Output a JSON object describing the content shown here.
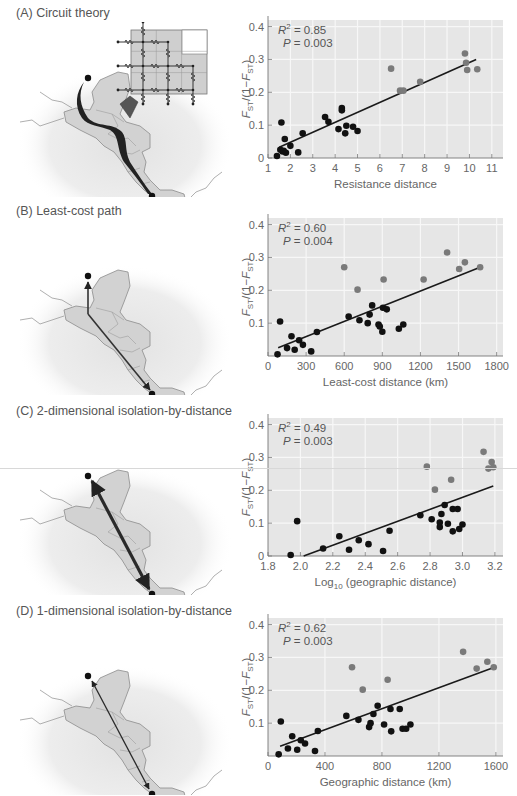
{
  "figure": {
    "panels": [
      {
        "id": "A",
        "title": "(A)  Circuit theory",
        "map_style": "circuit"
      },
      {
        "id": "B",
        "title": "(B)  Least-cost path",
        "map_style": "leastcost"
      },
      {
        "id": "C",
        "title": "(C)  2-dimensional isolation-by-distance",
        "map_style": "straight-thick"
      },
      {
        "id": "D",
        "title": "(D)  1-dimensional isolation-by-distance",
        "map_style": "straight-thin"
      }
    ]
  },
  "colors": {
    "plot_bg": "#e6e6e6",
    "grid": "#f7f7f7",
    "dot_dark": "#111111",
    "dot_gray": "#7a7a7a",
    "line": "#1a1a1a",
    "axis_text": "#666666",
    "map_land": "#d2d2d2",
    "map_halo": "#ececec"
  },
  "chart_data": [
    {
      "type": "scatter",
      "panel": "A",
      "title": "Circuit theory",
      "xlabel": "Resistance distance",
      "ylabel": "F_ST/(1−F_ST)",
      "xlim": [
        1,
        11.5
      ],
      "ylim": [
        0,
        0.42
      ],
      "xticks": [
        1,
        2,
        3,
        4,
        5,
        6,
        7,
        8,
        9,
        10,
        11
      ],
      "xtick_labels": [
        "1",
        "2",
        "3",
        "4",
        "5",
        "6",
        "7",
        "8",
        "9",
        "10",
        "11"
      ],
      "yticks": [
        0,
        0.1,
        0.2,
        0.3,
        0.4
      ],
      "ytick_labels": [
        "0",
        "0.1",
        "0.2",
        "0.3",
        "0.4"
      ],
      "grid": true,
      "annotation": {
        "r2": "= 0.85",
        "p": "= 0.003"
      },
      "fit_line": [
        [
          1.5,
          0.033
        ],
        [
          10.3,
          0.3
        ]
      ],
      "series": [
        {
          "name": "dark",
          "points": [
            [
              1.4,
              0.006
            ],
            [
              1.55,
              0.025
            ],
            [
              1.6,
              0.108
            ],
            [
              1.65,
              0.02
            ],
            [
              1.7,
              0.022
            ],
            [
              1.75,
              0.058
            ],
            [
              1.8,
              0.016
            ],
            [
              2.0,
              0.037
            ],
            [
              2.35,
              0.017
            ],
            [
              2.55,
              0.075
            ],
            [
              3.55,
              0.125
            ],
            [
              3.7,
              0.11
            ],
            [
              4.15,
              0.088
            ],
            [
              4.3,
              0.152
            ],
            [
              4.3,
              0.145
            ],
            [
              4.45,
              0.075
            ],
            [
              4.5,
              0.098
            ],
            [
              4.8,
              0.095
            ],
            [
              5.0,
              0.082
            ]
          ]
        },
        {
          "name": "gray",
          "points": [
            [
              6.5,
              0.272
            ],
            [
              6.9,
              0.205
            ],
            [
              7.05,
              0.205
            ],
            [
              7.8,
              0.232
            ],
            [
              9.8,
              0.318
            ],
            [
              9.85,
              0.29
            ],
            [
              9.9,
              0.268
            ],
            [
              10.35,
              0.27
            ]
          ]
        }
      ]
    },
    {
      "type": "scatter",
      "panel": "B",
      "title": "Least-cost path",
      "xlabel": "Least-cost distance (km)",
      "ylabel": "F_ST/(1−F_ST)",
      "xlim": [
        0,
        1850
      ],
      "ylim": [
        0,
        0.42
      ],
      "xticks": [
        0,
        300,
        600,
        900,
        1200,
        1500,
        1800
      ],
      "xtick_labels": [
        "0",
        "300",
        "600",
        "900",
        "1200",
        "1500",
        "1800"
      ],
      "yticks": [
        0.1,
        0.2,
        0.3,
        0.4
      ],
      "ytick_labels": [
        "0.1",
        "0.2",
        "0.3",
        "0.4"
      ],
      "grid": true,
      "annotation": {
        "r2": "= 0.60",
        "p": "= 0.004"
      },
      "fit_line": [
        [
          80,
          0.025
        ],
        [
          1670,
          0.27
        ]
      ],
      "series": [
        {
          "name": "dark",
          "points": [
            [
              75,
              0.005
            ],
            [
              95,
              0.105
            ],
            [
              150,
              0.024
            ],
            [
              185,
              0.06
            ],
            [
              210,
              0.019
            ],
            [
              245,
              0.048
            ],
            [
              275,
              0.034
            ],
            [
              340,
              0.014
            ],
            [
              385,
              0.073
            ],
            [
              635,
              0.12
            ],
            [
              720,
              0.109
            ],
            [
              785,
              0.1
            ],
            [
              800,
              0.126
            ],
            [
              820,
              0.154
            ],
            [
              870,
              0.096
            ],
            [
              880,
              0.09
            ],
            [
              900,
              0.074
            ],
            [
              905,
              0.147
            ],
            [
              935,
              0.142
            ],
            [
              1030,
              0.083
            ],
            [
              1065,
              0.096
            ]
          ]
        },
        {
          "name": "gray",
          "points": [
            [
              600,
              0.27
            ],
            [
              705,
              0.202
            ],
            [
              910,
              0.233
            ],
            [
              1225,
              0.233
            ],
            [
              1410,
              0.315
            ],
            [
              1505,
              0.265
            ],
            [
              1550,
              0.285
            ],
            [
              1670,
              0.27
            ]
          ]
        }
      ]
    },
    {
      "type": "scatter",
      "panel": "C",
      "title": "2-dimensional isolation-by-distance",
      "xlabel": "Log10 (geographic distance)",
      "ylabel": "F_ST/(1−F_ST)",
      "xlim": [
        1.8,
        3.25
      ],
      "ylim": [
        0,
        0.42
      ],
      "xticks": [
        1.8,
        2.0,
        2.2,
        2.4,
        2.6,
        2.8,
        3.0,
        3.2
      ],
      "xtick_labels": [
        "1.8",
        "2.0",
        "2.2",
        "2.4",
        "2.6",
        "2.8",
        "3.0",
        "3.2"
      ],
      "yticks": [
        0,
        0.1,
        0.2,
        0.3,
        0.4
      ],
      "ytick_labels": [
        "0",
        "0.1",
        "0.2",
        "0.3",
        "0.4"
      ],
      "grid": true,
      "annotation": {
        "r2": "= 0.49",
        "p": "= 0.003"
      },
      "fit_line": [
        [
          2.02,
          0.0
        ],
        [
          3.19,
          0.213
        ]
      ],
      "series": [
        {
          "name": "dark",
          "points": [
            [
              1.94,
              0.003
            ],
            [
              1.98,
              0.106
            ],
            [
              2.14,
              0.023
            ],
            [
              2.24,
              0.06
            ],
            [
              2.3,
              0.019
            ],
            [
              2.36,
              0.048
            ],
            [
              2.42,
              0.036
            ],
            [
              2.51,
              0.015
            ],
            [
              2.55,
              0.077
            ],
            [
              2.74,
              0.124
            ],
            [
              2.81,
              0.112
            ],
            [
              2.86,
              0.102
            ],
            [
              2.86,
              0.088
            ],
            [
              2.87,
              0.128
            ],
            [
              2.89,
              0.155
            ],
            [
              2.91,
              0.098
            ],
            [
              2.94,
              0.143
            ],
            [
              2.94,
              0.075
            ],
            [
              2.97,
              0.143
            ],
            [
              2.98,
              0.082
            ],
            [
              3.0,
              0.096
            ]
          ]
        },
        {
          "name": "gray",
          "points": [
            [
              2.78,
              0.272
            ],
            [
              2.83,
              0.202
            ],
            [
              2.93,
              0.232
            ],
            [
              3.13,
              0.317
            ],
            [
              3.16,
              0.266
            ],
            [
              3.18,
              0.286
            ],
            [
              3.19,
              0.27
            ]
          ]
        }
      ]
    },
    {
      "type": "scatter",
      "panel": "D",
      "title": "1-dimensional isolation-by-distance",
      "xlabel": "Geographic distance (km)",
      "ylabel": "F_ST/(1−F_ST)",
      "xlim": [
        0,
        1650
      ],
      "ylim": [
        0,
        0.42
      ],
      "xticks": [
        0,
        400,
        800,
        1200,
        1600
      ],
      "xtick_labels": [
        "0",
        "400",
        "800",
        "1200",
        "1600"
      ],
      "yticks": [
        0.1,
        0.2,
        0.3,
        0.4
      ],
      "ytick_labels": [
        "0.1",
        "0.2",
        "0.3",
        "0.4"
      ],
      "grid": true,
      "annotation": {
        "r2": "= 0.62",
        "p": "= 0.003"
      },
      "fit_line": [
        [
          85,
          0.03
        ],
        [
          1590,
          0.27
        ]
      ],
      "series": [
        {
          "name": "dark",
          "points": [
            [
              75,
              0.005
            ],
            [
              90,
              0.105
            ],
            [
              140,
              0.023
            ],
            [
              170,
              0.06
            ],
            [
              205,
              0.019
            ],
            [
              230,
              0.048
            ],
            [
              260,
              0.038
            ],
            [
              330,
              0.015
            ],
            [
              350,
              0.076
            ],
            [
              550,
              0.122
            ],
            [
              635,
              0.11
            ],
            [
              710,
              0.088
            ],
            [
              720,
              0.1
            ],
            [
              740,
              0.128
            ],
            [
              770,
              0.153
            ],
            [
              815,
              0.096
            ],
            [
              860,
              0.143
            ],
            [
              865,
              0.075
            ],
            [
              925,
              0.143
            ],
            [
              945,
              0.083
            ],
            [
              970,
              0.083
            ],
            [
              1000,
              0.096
            ]
          ]
        },
        {
          "name": "gray",
          "points": [
            [
              590,
              0.27
            ],
            [
              665,
              0.202
            ],
            [
              840,
              0.232
            ],
            [
              1370,
              0.317
            ],
            [
              1465,
              0.266
            ],
            [
              1540,
              0.287
            ],
            [
              1585,
              0.27
            ]
          ]
        }
      ]
    }
  ]
}
